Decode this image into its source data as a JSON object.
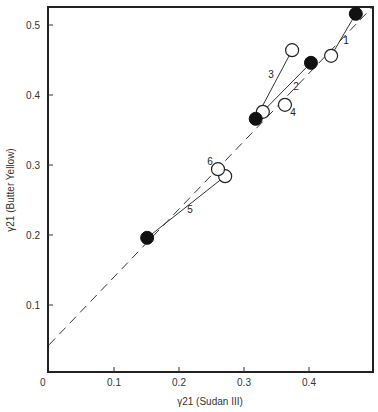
{
  "chart_data": {
    "type": "scatter",
    "title": "",
    "xlabel": "γ21 (Sudan III)",
    "ylabel": "γ21 (Butter Yellow)",
    "xlim": [
      0,
      0.5
    ],
    "ylim": [
      0,
      0.53
    ],
    "x_ticks": [
      "0",
      "0.1",
      "0.2",
      "0.3",
      "0.4"
    ],
    "y_ticks": [
      "0.1",
      "0.2",
      "0.3",
      "0.4",
      "0.5"
    ],
    "grid": false,
    "legend": "none",
    "reference_line": {
      "style": "dashed",
      "x": [
        0,
        0.5
      ],
      "y": [
        0.043,
        0.528
      ]
    },
    "series": [
      {
        "name": "filled (reference)",
        "marker": "filled-circle",
        "points": [
          {
            "x": 0.151,
            "y": 0.196
          },
          {
            "x": 0.318,
            "y": 0.366
          },
          {
            "x": 0.403,
            "y": 0.446
          },
          {
            "x": 0.472,
            "y": 0.516
          }
        ]
      },
      {
        "name": "open (numbered)",
        "marker": "open-circle",
        "points": [
          {
            "label": "1",
            "x": 0.434,
            "y": 0.456
          },
          {
            "label": "2",
            "x": 0.329,
            "y": 0.376
          },
          {
            "label": "3",
            "x": 0.374,
            "y": 0.464
          },
          {
            "label": "4",
            "x": 0.363,
            "y": 0.386
          },
          {
            "label": "5",
            "x": 0.271,
            "y": 0.284
          },
          {
            "label": "6",
            "x": 0.26,
            "y": 0.294
          }
        ]
      }
    ],
    "connectors": [
      {
        "label": "1",
        "from": [
          0.472,
          0.516
        ],
        "to": [
          0.434,
          0.456
        ]
      },
      {
        "label": "2",
        "from": [
          0.403,
          0.446
        ],
        "to": [
          0.318,
          0.366
        ]
      },
      {
        "label": "3",
        "from": [
          0.318,
          0.366
        ],
        "to": [
          0.374,
          0.464
        ]
      },
      {
        "label": "5",
        "from": [
          0.151,
          0.196
        ],
        "to": [
          0.271,
          0.284
        ]
      }
    ],
    "annotations": [
      "1",
      "2",
      "3",
      "4",
      "5",
      "6"
    ]
  }
}
